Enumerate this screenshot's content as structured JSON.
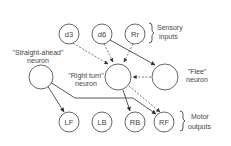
{
  "diagram": {
    "sensory_inputs": [
      {
        "id": "d3",
        "label": "d3"
      },
      {
        "id": "d6",
        "label": "d6"
      },
      {
        "id": "Rr",
        "label": "Rr"
      }
    ],
    "sensory_group_label_line1": "Sensory",
    "sensory_group_label_line2": "inputs",
    "neurons": {
      "straight_ahead": {
        "line1": "\"Straight-ahead\"",
        "line2": "neuron"
      },
      "right_turn": {
        "line1": "\"Right turn\"",
        "line2": "neuron"
      },
      "flee": {
        "line1": "\"Flee\"",
        "line2": "neuron"
      }
    },
    "motor_outputs": [
      {
        "id": "LF",
        "label": "LF"
      },
      {
        "id": "LB",
        "label": "LB"
      },
      {
        "id": "RB",
        "label": "RB"
      },
      {
        "id": "RF",
        "label": "RF"
      }
    ],
    "motor_group_label_line1": "Motor",
    "motor_group_label_line2": "outputs",
    "connections": [
      {
        "from": "d3",
        "to": "right_turn",
        "style": "dashed"
      },
      {
        "from": "d6",
        "to": "right_turn",
        "style": "dashed"
      },
      {
        "from": "Rr",
        "to": "right_turn",
        "style": "dashed"
      },
      {
        "from": "d6",
        "to": "flee",
        "style": "solid"
      },
      {
        "from": "flee",
        "to": "right_turn",
        "style": "dashed"
      },
      {
        "from": "right_turn",
        "to": "RB",
        "style": "solid"
      },
      {
        "from": "right_turn",
        "to": "RF",
        "style": "dashed"
      },
      {
        "from": "straight_ahead",
        "to": "LF",
        "style": "solid"
      },
      {
        "from": "straight_ahead",
        "to": "RF",
        "style": "solid"
      }
    ]
  }
}
